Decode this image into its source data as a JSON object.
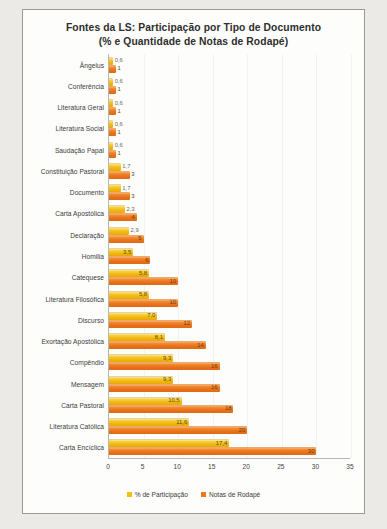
{
  "chart_data": {
    "type": "bar",
    "orientation": "horizontal",
    "title": "Fontes da LS: Participação por Tipo de Documento (% e Quantidade de Notas de Rodapé)",
    "title_lines": [
      "Fontes da LS: Participação por Tipo de Documento",
      "(% e Quantidade de Notas de Rodapé)"
    ],
    "xlabel": "",
    "ylabel": "",
    "xlim": [
      0,
      35
    ],
    "xticks": [
      "0",
      "5",
      "10",
      "15",
      "20",
      "25",
      "30",
      "35"
    ],
    "grid": true,
    "legend_position": "bottom",
    "categories": [
      "Ângelus",
      "Conferência",
      "Literatura Geral",
      "Literatura Social",
      "Saudação Papal",
      "Constituição Pastoral",
      "Documento",
      "Carta Apostólica",
      "Declaração",
      "Homilia",
      "Catequese",
      "Literatura Filosófica",
      "Discurso",
      "Exortação Apostólica",
      "Compêndio",
      "Mensagem",
      "Carta Pastoral",
      "Literatura Católica",
      "Carta Encíclica"
    ],
    "series": [
      {
        "name": "% de Participação",
        "color": "#f0c017",
        "values": [
          0.6,
          0.6,
          0.6,
          0.6,
          0.6,
          1.7,
          1.7,
          2.3,
          2.9,
          3.5,
          5.8,
          5.8,
          7.0,
          8.1,
          9.3,
          9.3,
          10.5,
          11.6,
          17.4
        ],
        "labels": [
          "0,6",
          "0,6",
          "0,6",
          "0,6",
          "0,6",
          "1,7",
          "1,7",
          "2,3",
          "2,9",
          "3,5",
          "5,8",
          "5,8",
          "7,0",
          "8,1",
          "9,3",
          "9,3",
          "10,5",
          "11,6",
          "17,4"
        ]
      },
      {
        "name": "Notas de Rodapé",
        "color": "#ea7a1d",
        "values": [
          1,
          1,
          1,
          1,
          1,
          3,
          3,
          4,
          5,
          6,
          10,
          10,
          12,
          14,
          16,
          16,
          18,
          20,
          30
        ],
        "labels": [
          "1",
          "1",
          "1",
          "1",
          "1",
          "3",
          "3",
          "4",
          "5",
          "6",
          "10",
          "10",
          "12",
          "14",
          "16",
          "16",
          "18",
          "20",
          "30"
        ]
      }
    ]
  },
  "legend": {
    "items": [
      {
        "label": "% de Participação"
      },
      {
        "label": "Notas de Rodapé"
      }
    ]
  }
}
